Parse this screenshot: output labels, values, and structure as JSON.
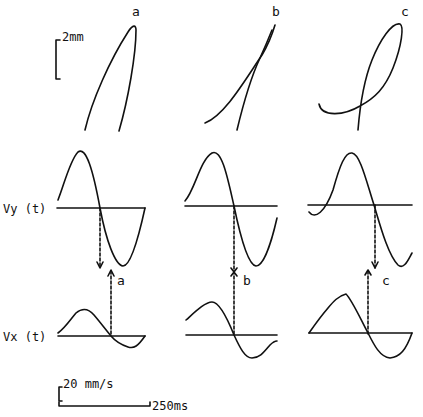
{
  "figure": {
    "panels": [
      {
        "id": "a",
        "label": "a",
        "arrow_label": "a"
      },
      {
        "id": "b",
        "label": "b",
        "arrow_label": "b"
      },
      {
        "id": "c",
        "label": "c",
        "arrow_label": "c"
      }
    ],
    "row_labels": {
      "vy": "Vy (t)",
      "vx": "Vx (t)"
    },
    "scale_bars": {
      "position": "2mm",
      "velocity": "20 mm/s",
      "time": "250ms"
    },
    "colors": {
      "ink": "#111111",
      "background": "#ffffff"
    }
  }
}
